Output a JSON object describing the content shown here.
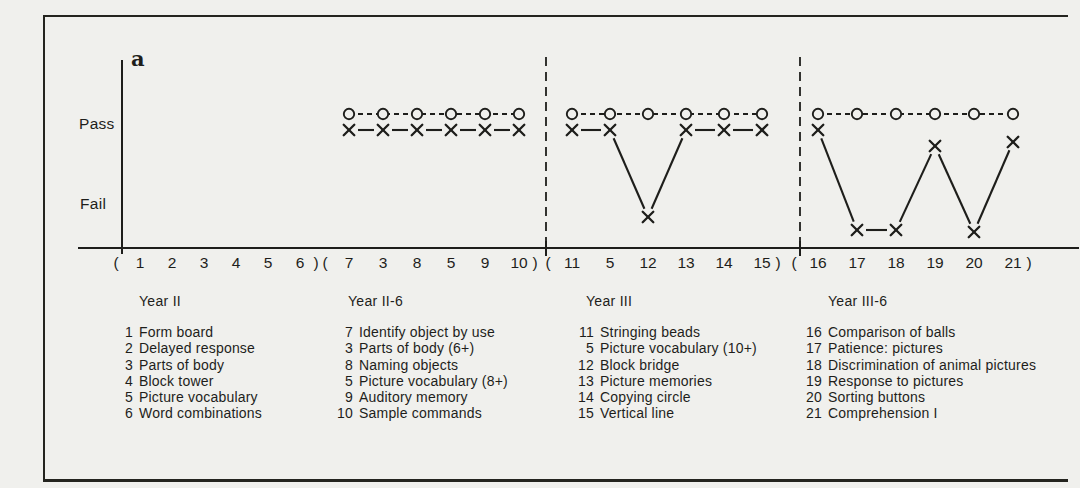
{
  "figure": {
    "panel_label": "a"
  },
  "colors": {
    "ink": "#1e1e1b",
    "background": "#f0f0ed"
  },
  "chart_data": {
    "type": "line",
    "y_categories": [
      "Pass",
      "Fail"
    ],
    "series": [
      {
        "name": "circle-series",
        "marker": "o",
        "line_style": "dashed"
      },
      {
        "name": "x-series",
        "marker": "x",
        "line_style": "solid"
      }
    ],
    "paren_open": "(",
    "paren_close": ")",
    "groups": [
      {
        "label": "Year II",
        "item_numbers": [
          "1",
          "2",
          "3",
          "4",
          "5",
          "6"
        ],
        "circle_values": [],
        "x_values": [],
        "x_levels": []
      },
      {
        "label": "Year II-6",
        "item_numbers": [
          "7",
          "3",
          "8",
          "5",
          "9",
          "10"
        ],
        "circle_values": [
          "pass",
          "pass",
          "pass",
          "pass",
          "pass",
          "pass"
        ],
        "x_values": [
          "pass",
          "pass",
          "pass",
          "pass",
          "pass",
          "pass"
        ],
        "x_levels": [
          1,
          1,
          1,
          1,
          1,
          1
        ]
      },
      {
        "label": "Year III",
        "item_numbers": [
          "11",
          "5",
          "12",
          "13",
          "14",
          "15"
        ],
        "circle_values": [
          "pass",
          "pass",
          "pass",
          "pass",
          "pass",
          "pass"
        ],
        "x_values": [
          "pass",
          "pass",
          "fail",
          "pass",
          "pass",
          "pass"
        ],
        "x_levels": [
          1,
          1,
          0.13,
          1,
          1,
          1
        ]
      },
      {
        "label": "Year III-6",
        "item_numbers": [
          "16",
          "17",
          "18",
          "19",
          "20",
          "21"
        ],
        "circle_values": [
          "pass",
          "pass",
          "pass",
          "pass",
          "pass",
          "pass"
        ],
        "x_values": [
          "pass",
          "fail",
          "fail",
          "pass",
          "fail",
          "pass"
        ],
        "x_levels": [
          1,
          0,
          0,
          0.84,
          -0.02,
          0.88
        ]
      }
    ]
  },
  "legend": {
    "groups": [
      {
        "label": "Year II",
        "items": [
          {
            "num": "1",
            "name": "Form board"
          },
          {
            "num": "2",
            "name": "Delayed response"
          },
          {
            "num": "3",
            "name": "Parts of body"
          },
          {
            "num": "4",
            "name": "Block tower"
          },
          {
            "num": "5",
            "name": "Picture vocabulary"
          },
          {
            "num": "6",
            "name": "Word combinations"
          }
        ]
      },
      {
        "label": "Year II-6",
        "items": [
          {
            "num": "7",
            "name": "Identify object by use"
          },
          {
            "num": "3",
            "name": "Parts of body (6+)"
          },
          {
            "num": "8",
            "name": "Naming objects"
          },
          {
            "num": "5",
            "name": "Picture vocabulary (8+)"
          },
          {
            "num": "9",
            "name": "Auditory memory"
          },
          {
            "num": "10",
            "name": "Sample commands"
          }
        ]
      },
      {
        "label": "Year III",
        "items": [
          {
            "num": "11",
            "name": "Stringing beads"
          },
          {
            "num": "5",
            "name": "Picture vocabulary (10+)"
          },
          {
            "num": "12",
            "name": "Block bridge"
          },
          {
            "num": "13",
            "name": "Picture memories"
          },
          {
            "num": "14",
            "name": "Copying circle"
          },
          {
            "num": "15",
            "name": "Vertical line"
          }
        ]
      },
      {
        "label": "Year III-6",
        "items": [
          {
            "num": "16",
            "name": "Comparison of balls"
          },
          {
            "num": "17",
            "name": "Patience: pictures"
          },
          {
            "num": "18",
            "name": "Discrimination of animal pictures"
          },
          {
            "num": "19",
            "name": "Response to pictures"
          },
          {
            "num": "20",
            "name": "Sorting buttons"
          },
          {
            "num": "21",
            "name": "Comprehension I"
          }
        ]
      }
    ]
  }
}
